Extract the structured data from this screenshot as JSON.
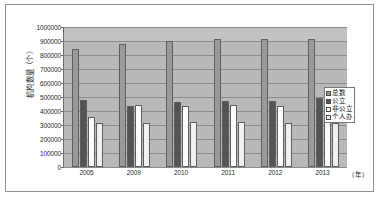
{
  "chart_data": {
    "type": "bar",
    "title": "",
    "xlabel": "（年）",
    "ylabel": "机构数量（个）",
    "ylim": [
      0,
      1000000
    ],
    "ytick_step": 100000,
    "grid": true,
    "legend_position": "right",
    "categories": [
      "2005",
      "2009",
      "2010",
      "2011",
      "2012",
      "2013"
    ],
    "yticks": [
      "1000000",
      "900000",
      "800000",
      "700000",
      "600000",
      "500000",
      "400000",
      "300000",
      "200000",
      "100000",
      "0"
    ],
    "series": [
      {
        "name": "总数",
        "color": "#9a9a9a",
        "values": [
          845000,
          880000,
          900000,
          917000,
          915000,
          915000
        ]
      },
      {
        "name": "公立",
        "color": "#545454",
        "values": [
          480000,
          433000,
          462000,
          468000,
          473000,
          490000
        ]
      },
      {
        "name": "非公立",
        "color": "#fdfdfd",
        "values": [
          360000,
          440000,
          437000,
          445000,
          435000,
          422000
        ]
      },
      {
        "name": "个人办",
        "color": "#f0f0f0",
        "values": [
          315000,
          317000,
          320000,
          322000,
          315000,
          317000
        ]
      }
    ]
  }
}
